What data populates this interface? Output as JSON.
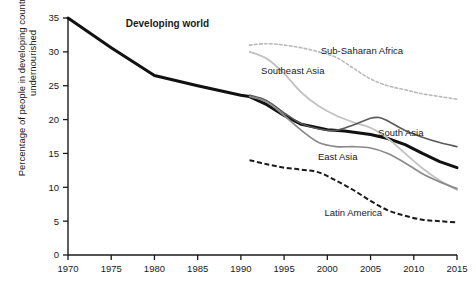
{
  "chart_data": {
    "type": "line",
    "title": "",
    "xlabel": "",
    "ylabel": "Percentage of people in developing countries who are undernourished",
    "xlim": [
      1970,
      2015
    ],
    "ylim": [
      0,
      35
    ],
    "xticks": [
      "1970",
      "1975",
      "1980",
      "1985",
      "1990",
      "1995",
      "2000",
      "2005",
      "2010",
      "2015"
    ],
    "yticks": [
      "0",
      "5",
      "10",
      "15",
      "20",
      "25",
      "30",
      "35"
    ],
    "grid": false,
    "legend_position": "inline-annotations",
    "series": [
      {
        "name": "Developing world",
        "style": "solid-thick-black",
        "color": "#111111",
        "label_x": 1981.5,
        "label_y": 34.2,
        "bold": true,
        "x": [
          1970,
          1975,
          1980,
          1985,
          1990,
          1991,
          1993,
          1995,
          1997,
          2000,
          2002,
          2005,
          2007,
          2009,
          2011,
          2013,
          2015
        ],
        "y": [
          35.0,
          30.6,
          26.5,
          25.0,
          23.6,
          23.4,
          22.2,
          20.6,
          19.3,
          18.5,
          18.3,
          17.8,
          17.2,
          16.3,
          15.0,
          13.8,
          12.9
        ]
      },
      {
        "name": "Sub-Saharan Africa",
        "style": "dotted-light-gray",
        "color": "#b9b9b9",
        "label_x": 2004.0,
        "label_y": 30.2,
        "bold": false,
        "x": [
          1991,
          1993,
          1995,
          1997,
          1999,
          2001,
          2003,
          2005,
          2007,
          2009,
          2011,
          2013,
          2015
        ],
        "y": [
          31.0,
          31.2,
          31.0,
          30.6,
          30.0,
          29.2,
          27.6,
          26.0,
          25.0,
          24.4,
          23.8,
          23.4,
          23.0
        ]
      },
      {
        "name": "Southeast Asia",
        "style": "solid-light-gray",
        "color": "#c2c2c2",
        "label_x": 1996.0,
        "label_y": 27.2,
        "bold": false,
        "x": [
          1991,
          1993,
          1995,
          1997,
          1999,
          2001,
          2003,
          2005,
          2007,
          2009,
          2011,
          2013,
          2015
        ],
        "y": [
          30.0,
          29.0,
          26.8,
          24.0,
          22.0,
          20.6,
          19.6,
          18.8,
          17.2,
          15.0,
          12.8,
          11.0,
          9.6
        ]
      },
      {
        "name": "South Asia",
        "style": "solid-dark-gray-thin",
        "color": "#5a5a5a",
        "label_x": 2008.5,
        "label_y": 18.1,
        "bold": false,
        "x": [
          1991,
          1993,
          1995,
          1997,
          1999,
          2001,
          2003,
          2005,
          2006,
          2007,
          2009,
          2011,
          2013,
          2015
        ],
        "y": [
          23.6,
          22.8,
          21.0,
          19.4,
          18.6,
          18.4,
          19.2,
          20.2,
          20.3,
          19.8,
          18.4,
          17.4,
          16.6,
          16.0
        ]
      },
      {
        "name": "East Asia",
        "style": "solid-medium-gray",
        "color": "#8a8a8a",
        "label_x": 2001.2,
        "label_y": 14.6,
        "bold": false,
        "x": [
          1991,
          1993,
          1995,
          1997,
          1999,
          2001,
          2003,
          2005,
          2007,
          2009,
          2011,
          2013,
          2015
        ],
        "y": [
          23.4,
          22.6,
          20.6,
          18.4,
          16.6,
          16.0,
          16.0,
          15.8,
          15.0,
          13.6,
          12.0,
          10.8,
          9.8
        ]
      },
      {
        "name": "Latin America",
        "style": "dashed-black",
        "color": "#1a1a1a",
        "label_x": 2003.0,
        "label_y": 6.2,
        "bold": false,
        "x": [
          1991,
          1993,
          1995,
          1997,
          1999,
          2001,
          2003,
          2005,
          2007,
          2009,
          2011,
          2013,
          2015
        ],
        "y": [
          14.0,
          13.4,
          12.9,
          12.6,
          12.2,
          11.0,
          9.6,
          8.0,
          6.6,
          5.8,
          5.2,
          5.0,
          4.8
        ]
      }
    ]
  }
}
